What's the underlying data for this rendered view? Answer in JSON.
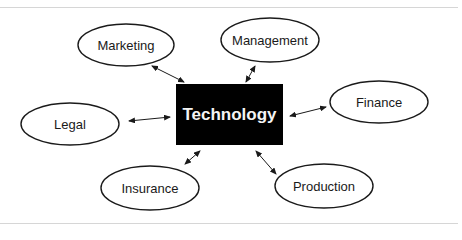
{
  "diagram": {
    "hub": {
      "label": "Technology",
      "x": 176,
      "y": 84,
      "w": 107,
      "h": 61,
      "fill": "#000000",
      "text_color": "#f4f4f4"
    },
    "nodes": [
      {
        "id": "marketing",
        "label": "Marketing",
        "cx": 126,
        "cy": 45,
        "rx": 48,
        "ry": 21
      },
      {
        "id": "management",
        "label": "Management",
        "cx": 270,
        "cy": 40,
        "rx": 49,
        "ry": 22
      },
      {
        "id": "finance",
        "label": "Finance",
        "cx": 379,
        "cy": 102,
        "rx": 49,
        "ry": 21
      },
      {
        "id": "legal",
        "label": "Legal",
        "cx": 70,
        "cy": 124,
        "rx": 49,
        "ry": 21
      },
      {
        "id": "insurance",
        "label": "Insurance",
        "cx": 150,
        "cy": 188,
        "rx": 49,
        "ry": 22
      },
      {
        "id": "production",
        "label": "Production",
        "cx": 324,
        "cy": 186,
        "rx": 49,
        "ry": 22
      }
    ],
    "edges": [
      {
        "to": "marketing",
        "x1": 152,
        "y1": 66,
        "x2": 184,
        "y2": 82,
        "style": "bidirectional"
      },
      {
        "to": "management",
        "x1": 255,
        "y1": 66,
        "x2": 246,
        "y2": 82,
        "style": "bidirectional"
      },
      {
        "to": "finance",
        "x1": 290,
        "y1": 116,
        "x2": 326,
        "y2": 107,
        "style": "bidirectional"
      },
      {
        "to": "legal",
        "x1": 129,
        "y1": 121,
        "x2": 170,
        "y2": 117,
        "style": "bidirectional"
      },
      {
        "to": "insurance",
        "x1": 185,
        "y1": 164,
        "x2": 200,
        "y2": 151,
        "style": "bidirectional"
      },
      {
        "to": "production",
        "x1": 256,
        "y1": 151,
        "x2": 276,
        "y2": 174,
        "style": "bidirectional"
      }
    ],
    "stroke_color": "#1a1a1a",
    "rule_color": "#d6d6d6"
  }
}
